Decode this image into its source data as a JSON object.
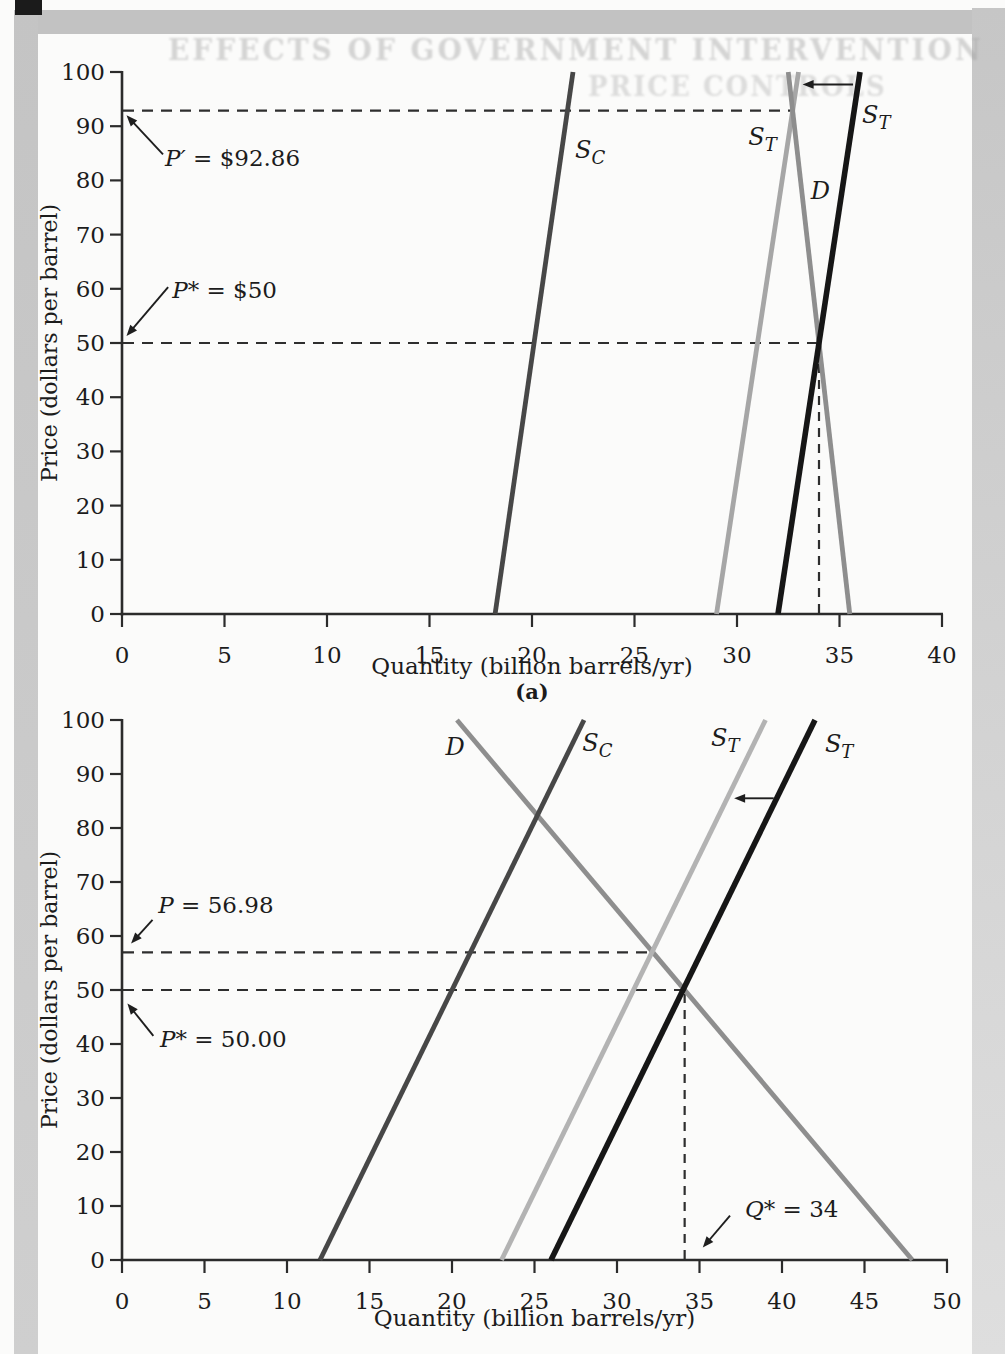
{
  "page": {
    "bleed_line1": "EFFECTS OF GOVERNMENT INTERVENTION",
    "bleed_line2": "PRICE CONTROLS",
    "background": "#fbfbfa",
    "scan_band_color": "#c2c2c2"
  },
  "chart_data": [
    {
      "type": "line",
      "panel_label": "(a)",
      "xlabel": "Quantity (billion barrels/yr)",
      "ylabel": "Price (dollars per barrel)",
      "xlim": [
        0,
        40
      ],
      "xtick_step": 5,
      "ylim": [
        0,
        100
      ],
      "ytick_step": 10,
      "grid": false,
      "series": [
        {
          "name": "competitive-supply-line",
          "label": "S_C",
          "color": "#474747",
          "width": 4.8,
          "points": [
            [
              18.2,
              0
            ],
            [
              22,
              100
            ]
          ],
          "label_at": [
            22.1,
            84.2
          ]
        },
        {
          "name": "total-supply-shifted-line",
          "label": "S_T",
          "color": "#a6a6a6",
          "width": 4.8,
          "points": [
            [
              29,
              0
            ],
            [
              33,
              100
            ]
          ],
          "label_at": [
            30.55,
            86.5
          ]
        },
        {
          "name": "demand-line",
          "label": "D",
          "color": "#8e8e8e",
          "width": 4.8,
          "points": [
            [
              35.5,
              0
            ],
            [
              32.5,
              100
            ]
          ],
          "label_at": [
            33.6,
            76.5
          ]
        },
        {
          "name": "total-supply-line",
          "label": "S_T",
          "color": "#161616",
          "width": 5.6,
          "points": [
            [
              32,
              0
            ],
            [
              36,
              100
            ]
          ],
          "label_at": [
            36.1,
            90.5
          ]
        }
      ],
      "guides": [
        {
          "kind": "h",
          "y": 92.86,
          "x_to": 32.71
        },
        {
          "kind": "h",
          "y": 50,
          "x_to": 34.0
        },
        {
          "kind": "v",
          "x": 34.0,
          "y_to": 50
        }
      ],
      "annotations": [
        {
          "text": "P′ = $92.86",
          "at": [
            2.1,
            82.6
          ],
          "arrow": {
            "from": [
              2.0,
              84.8
            ],
            "to": [
              0.22,
              92.0
            ]
          }
        },
        {
          "text": "P* = $50",
          "at": [
            2.45,
            58.3
          ],
          "arrow": {
            "from": [
              2.25,
              60.3
            ],
            "to": [
              0.22,
              51.3
            ]
          }
        }
      ],
      "shift_arrow": {
        "from": [
          35.66,
          97.7
        ],
        "to": [
          33.2,
          97.7
        ]
      },
      "key_values": {
        "P_prime": 92.86,
        "P_star": 50,
        "Q_star": 34
      }
    },
    {
      "type": "line",
      "panel_label": "",
      "xlabel": "Quantity (billion barrels/yr)",
      "ylabel": "Price (dollars per barrel)",
      "xlim": [
        0,
        50
      ],
      "xtick_step": 5,
      "ylim": [
        0,
        100
      ],
      "ytick_step": 10,
      "grid": false,
      "series": [
        {
          "name": "demand-line",
          "label": "D",
          "color": "#8e8e8e",
          "width": 4.8,
          "points": [
            [
              47.9,
              0
            ],
            [
              20.3,
              100
            ]
          ],
          "label_at": [
            19.6,
            93.5
          ]
        },
        {
          "name": "competitive-supply-line",
          "label": "S_C",
          "color": "#474747",
          "width": 4.8,
          "points": [
            [
              12,
              0
            ],
            [
              28,
              100
            ]
          ],
          "label_at": [
            27.9,
            94.3
          ]
        },
        {
          "name": "total-supply-shifted-line",
          "label": "S_T",
          "color": "#b3b3b3",
          "width": 4.8,
          "points": [
            [
              23,
              0
            ],
            [
              39,
              100
            ]
          ],
          "label_at": [
            35.7,
            95.2
          ]
        },
        {
          "name": "total-supply-line",
          "label": "S_T",
          "color": "#161616",
          "width": 5.6,
          "points": [
            [
              26,
              0
            ],
            [
              42,
              100
            ]
          ],
          "label_at": [
            42.6,
            94.0
          ]
        }
      ],
      "guides": [
        {
          "kind": "h",
          "y": 56.98,
          "x_to": 32.2
        },
        {
          "kind": "h",
          "y": 50,
          "x_to": 34.1
        },
        {
          "kind": "v",
          "x": 34.1,
          "y_to": 50
        }
      ],
      "annotations": [
        {
          "text": "P = 56.98",
          "at": [
            2.2,
            64.2
          ],
          "arrow": {
            "from": [
              1.85,
              63.0
            ],
            "to": [
              0.55,
              58.6
            ]
          }
        },
        {
          "text": "P* = 50.00",
          "at": [
            2.3,
            39.5
          ],
          "arrow": {
            "from": [
              1.9,
              41.5
            ],
            "to": [
              0.33,
              47.5
            ]
          }
        },
        {
          "text": "Q* = 34",
          "at": [
            37.75,
            8.0
          ],
          "arrow": {
            "from": [
              36.85,
              8.2
            ],
            "to": [
              35.2,
              2.3
            ]
          }
        }
      ],
      "shift_arrow": {
        "from": [
          39.5,
          85.5
        ],
        "to": [
          37.1,
          85.5
        ]
      },
      "key_values": {
        "P": 56.98,
        "P_star": 50.0,
        "Q_star": 34
      }
    }
  ]
}
